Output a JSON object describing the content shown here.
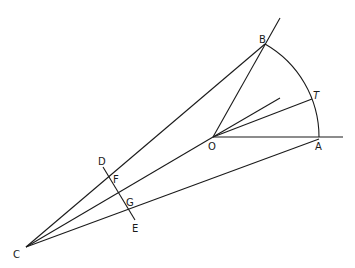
{
  "diagram": {
    "points": {
      "A": {
        "label": "A"
      },
      "B": {
        "label": "B"
      },
      "C": {
        "label": "C"
      },
      "D": {
        "label": "D"
      },
      "E": {
        "label": "E"
      },
      "F": {
        "label": "F"
      },
      "G": {
        "label": "G"
      },
      "O": {
        "label": "O"
      },
      "T": {
        "label": "T"
      }
    },
    "segments": [
      "CB",
      "CO",
      "CA",
      "OB",
      "OT",
      "OA",
      "DE",
      "arc AB"
    ]
  }
}
